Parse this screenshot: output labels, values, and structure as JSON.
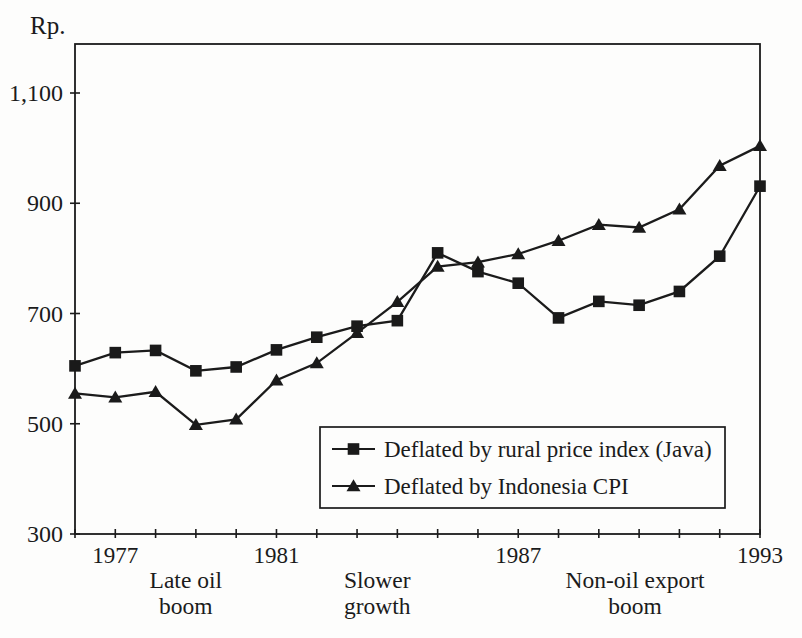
{
  "figure": {
    "background": "#fdfdfc",
    "ink_color": "#1b1b1b",
    "marker_fill": "#1a1a1a"
  },
  "chart_data": {
    "type": "line",
    "title": "",
    "ylabel": "Rp.",
    "xlabel": "",
    "grid": false,
    "xlim": [
      1976,
      1993
    ],
    "ylim": [
      300,
      1190
    ],
    "x": [
      1976,
      1977,
      1978,
      1979,
      1980,
      1981,
      1982,
      1983,
      1984,
      1985,
      1986,
      1987,
      1988,
      1989,
      1990,
      1991,
      1992,
      1993
    ],
    "x_tick_years": [
      1976,
      1977,
      1978,
      1979,
      1980,
      1981,
      1982,
      1983,
      1984,
      1985,
      1986,
      1987,
      1988,
      1989,
      1990,
      1991,
      1992,
      1993
    ],
    "x_tick_labels_shown": [
      "1977",
      "1981",
      "1987",
      "1993"
    ],
    "y_ticks": [
      300,
      500,
      700,
      900,
      1100
    ],
    "y_tick_labels": [
      "300",
      "500",
      "700",
      "900",
      "1,100"
    ],
    "legend_position": "inside lower-right box",
    "series": [
      {
        "name": "Deflated by rural price index (Java)",
        "marker": "square",
        "values": [
          605,
          629,
          633,
          596,
          603,
          634,
          657,
          677,
          687,
          810,
          776,
          755,
          692,
          722,
          715,
          740,
          804,
          931
        ]
      },
      {
        "name": "Deflated by Indonesia CPI",
        "marker": "triangle",
        "values": [
          555,
          548,
          558,
          498,
          508,
          579,
          610,
          665,
          721,
          785,
          793,
          808,
          832,
          861,
          856,
          889,
          968,
          1004
        ]
      }
    ],
    "annotations": [
      {
        "lines": [
          "Late oil",
          "boom"
        ],
        "center_year": 1978.75
      },
      {
        "lines": [
          "Slower",
          "growth"
        ],
        "center_year": 1983.5
      },
      {
        "lines": [
          "Non-oil export",
          "boom"
        ],
        "center_year": 1989.9
      }
    ]
  }
}
